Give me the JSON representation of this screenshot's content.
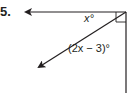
{
  "problem": {
    "number": "5.",
    "labels": {
      "angle1": "x°",
      "angle2": "(2x − 3)°"
    },
    "figure": {
      "type": "angle-diagram",
      "rays": [
        "horizontal-left",
        "diagonal-down-left",
        "vertical-down"
      ],
      "right_angle_marker": true
    },
    "colors": {
      "ink": "#231f20"
    }
  }
}
